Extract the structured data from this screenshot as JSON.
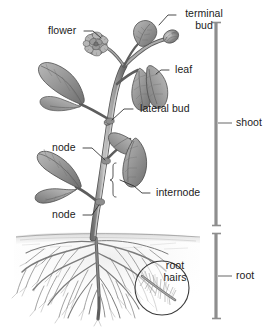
{
  "figure": {
    "background_color": "#ffffff",
    "ink_color": "#4a4a4a",
    "text_color": "#1c1c1c",
    "width": 272,
    "height": 331
  },
  "labels": {
    "flower": "flower",
    "terminal_bud_line1": "terminal",
    "terminal_bud_line2": "bud",
    "leaf": "leaf",
    "lateral_bud": "lateral bud",
    "node_upper": "node",
    "internode": "internode",
    "node_lower": "node",
    "root_hairs_line1": "root",
    "root_hairs_line2": "hairs",
    "shoot": "shoot",
    "root": "root"
  },
  "brackets": [
    {
      "name": "shoot",
      "label": "shoot",
      "top": 22,
      "bottom": 226,
      "tick_y": 123
    },
    {
      "name": "root",
      "label": "root",
      "top": 233,
      "bottom": 319,
      "tick_y": 276
    }
  ],
  "parts": [
    {
      "name": "flower",
      "label": "flower",
      "region": "shoot"
    },
    {
      "name": "terminal-bud",
      "label": "terminal bud",
      "region": "shoot"
    },
    {
      "name": "leaf",
      "label": "leaf",
      "region": "shoot"
    },
    {
      "name": "lateral-bud",
      "label": "lateral bud",
      "region": "shoot"
    },
    {
      "name": "node",
      "label": "node",
      "region": "shoot"
    },
    {
      "name": "internode",
      "label": "internode",
      "region": "shoot"
    },
    {
      "name": "root-hairs",
      "label": "root hairs",
      "region": "root"
    }
  ],
  "colors": {
    "ink": "#4a4a4a",
    "ink_dark": "#2e2e2e",
    "ink_light": "#9a9a9a",
    "soil": "#d8d8d8",
    "bracket": "#8e8e8e",
    "leader": "#2b2b2b"
  }
}
